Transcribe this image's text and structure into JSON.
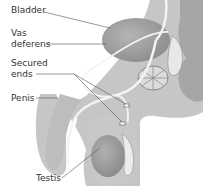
{
  "diagram": {
    "labels": {
      "bladder": "Bladder",
      "vas_line1": "Vas",
      "vas_line2": "deferens",
      "secured_line1": "Secured",
      "secured_line2": "ends",
      "penis": "Penis",
      "testis": "Testis"
    },
    "colors": {
      "background": "#ffffff",
      "body": "#c9c9c9",
      "body_dark": "#a8a8a8",
      "organ": "#9a9a9a",
      "tube": "#f2f2f2",
      "line": "#555555",
      "text": "#333333"
    }
  }
}
